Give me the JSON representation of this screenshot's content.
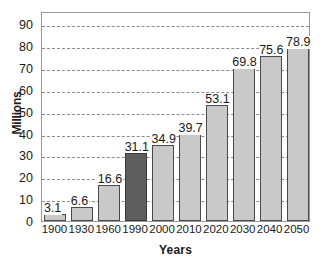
{
  "chart_data": {
    "type": "bar",
    "title": "",
    "subtitle": "",
    "xlabel": "Years",
    "ylabel": "Millions",
    "categories": [
      "1900",
      "1930",
      "1960",
      "1990",
      "2000",
      "2010",
      "2020",
      "2030",
      "2040",
      "2050"
    ],
    "values": [
      3.1,
      6.6,
      16.6,
      31.1,
      34.9,
      39.7,
      53.1,
      69.8,
      75.6,
      78.9
    ],
    "data_labels": [
      "3.1",
      "6.6",
      "16.6",
      "31.1",
      "34.9",
      "39.7",
      "53.1",
      "69.8",
      "75.6",
      "78.9"
    ],
    "ylim": [
      0,
      96
    ],
    "yticks": [
      0,
      10,
      20,
      30,
      40,
      50,
      60,
      70,
      80,
      90
    ],
    "ytick_labels": [
      "0",
      "10",
      "20",
      "30",
      "40",
      "50",
      "60",
      "70",
      "80",
      "90"
    ],
    "grid": true,
    "grid_axis": "y",
    "grid_style": "dashed",
    "legend": false,
    "legend_position": "none",
    "highlighted_category": "1990",
    "colors": {
      "bar_fill": "#c9c9c9",
      "bar_border": "#4a4a4a",
      "highlight_fill": "#5e5e5e",
      "highlight_border": "#3a3a3a",
      "gridline": "#8a8a8a",
      "frame": "#999999",
      "background": "#ffffff",
      "text": "#1a1a1a"
    }
  }
}
